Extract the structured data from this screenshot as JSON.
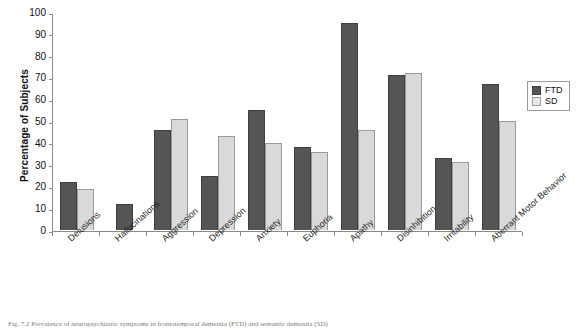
{
  "chart_data": {
    "type": "bar",
    "title": "",
    "xlabel": "",
    "ylabel": "Percentage of Subjects",
    "ylim": [
      0,
      100
    ],
    "ytick_step": 10,
    "yticks": [
      100,
      90,
      80,
      70,
      60,
      50,
      40,
      30,
      20,
      10,
      0
    ],
    "grid": false,
    "legend_position": "right",
    "categories": [
      "Delusions",
      "Hallucinations",
      "Aggression",
      "Depression",
      "Anxiety",
      "Euphoria",
      "Apathy",
      "Disinhibition",
      "Irritability",
      "Aberrant Motor Behavior"
    ],
    "series": [
      {
        "name": "FTD",
        "color": "#555555",
        "values": [
          22,
          12,
          46,
          25,
          55,
          38,
          95,
          71,
          33,
          67
        ]
      },
      {
        "name": "SD",
        "color": "#d9d9d9",
        "values": [
          19,
          0,
          51,
          43,
          40,
          36,
          46,
          72,
          31,
          50
        ]
      }
    ]
  },
  "legend": {
    "items": [
      {
        "label": "FTD",
        "swatch": "dark-gray-swatch"
      },
      {
        "label": "SD",
        "swatch": "light-gray-swatch"
      }
    ]
  },
  "caption": {
    "text": "Fig. 7.2  Prevalence of neuropsychiatric symptoms in frontotemporal dementia (FTD) and semantic dementia (SD)"
  }
}
